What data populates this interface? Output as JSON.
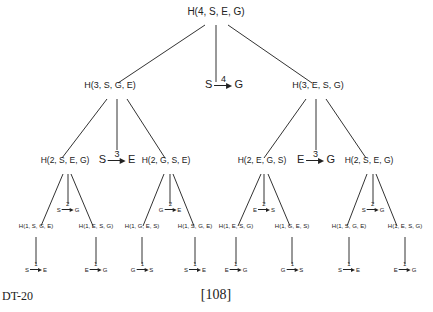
{
  "diagram": {
    "root": {
      "label": "H(4, S, E, G)",
      "x": 216,
      "y": 12
    },
    "level1": [
      {
        "label": "H(3, S, G, E)",
        "x": 110,
        "y": 86
      },
      {
        "label": "H(3, E, S, G)",
        "x": 318,
        "y": 86
      }
    ],
    "level1_move": {
      "from": "S",
      "to": "G",
      "step": "4",
      "x": 224,
      "y": 86
    },
    "level2": [
      {
        "label": "H(2, S, E, G)",
        "x": 65,
        "y": 161
      },
      {
        "label": "H(2, G, S, E)",
        "x": 166,
        "y": 161
      },
      {
        "label": "H(2, E, G, S)",
        "x": 262,
        "y": 161
      },
      {
        "label": "H(2, S, E, G)",
        "x": 369,
        "y": 161
      }
    ],
    "level2_moves": [
      {
        "from": "S",
        "to": "E",
        "step": "3",
        "x": 117,
        "y": 161
      },
      {
        "from": "E",
        "to": "G",
        "step": "3",
        "x": 316,
        "y": 161
      }
    ],
    "level3_moves": [
      {
        "from": "S",
        "to": "G",
        "step": "2",
        "x": 68,
        "y": 210
      },
      {
        "from": "G",
        "to": "E",
        "step": "2",
        "x": 170,
        "y": 210
      },
      {
        "from": "E",
        "to": "S",
        "step": "2",
        "x": 264,
        "y": 210
      },
      {
        "from": "S",
        "to": "G",
        "step": "2",
        "x": 373,
        "y": 210
      }
    ],
    "level3": [
      {
        "label": "H(1, S, G, E)",
        "x": 36,
        "y": 229
      },
      {
        "label": "H(1, E, S, G)",
        "x": 96,
        "y": 229
      },
      {
        "label": "H(1, G, E, S)",
        "x": 142,
        "y": 229
      },
      {
        "label": "H(1, S, G, E)",
        "x": 195,
        "y": 229
      },
      {
        "label": "H(1, E, S, G)",
        "x": 236,
        "y": 229
      },
      {
        "label": "H(1, G, E, S)",
        "x": 292,
        "y": 229
      },
      {
        "label": "H(1, S, G, E)",
        "x": 349,
        "y": 229
      },
      {
        "label": "H(1, E, S, G)",
        "x": 405,
        "y": 229
      }
    ],
    "leaf_moves": [
      {
        "from": "S",
        "to": "E",
        "step": "1",
        "x": 36,
        "y": 270
      },
      {
        "from": "E",
        "to": "G",
        "step": "1",
        "x": 96,
        "y": 270
      },
      {
        "from": "G",
        "to": "S",
        "step": "1",
        "x": 142,
        "y": 270
      },
      {
        "from": "S",
        "to": "E",
        "step": "1",
        "x": 195,
        "y": 270
      },
      {
        "from": "E",
        "to": "G",
        "step": "1",
        "x": 236,
        "y": 270
      },
      {
        "from": "G",
        "to": "S",
        "step": "1",
        "x": 292,
        "y": 270
      },
      {
        "from": "S",
        "to": "E",
        "step": "1",
        "x": 349,
        "y": 270
      },
      {
        "from": "E",
        "to": "G",
        "step": "1",
        "x": 405,
        "y": 270
      }
    ]
  },
  "footer": {
    "code": "DT-20",
    "page": "[108]"
  }
}
